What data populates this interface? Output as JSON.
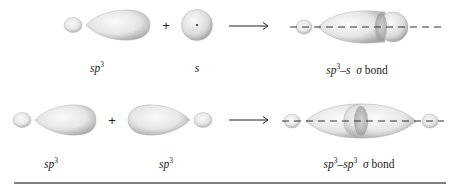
{
  "figure": {
    "row1": {
      "orbital_a": {
        "label_main": "sp",
        "label_sup": "3"
      },
      "operator": "+",
      "orbital_b": {
        "label_main": "s",
        "label_sup": ""
      },
      "result": {
        "label_a": "sp",
        "label_a_sup": "3",
        "dash": "–",
        "label_b": "s",
        "bond_symbol": "σ",
        "bond_word": "bond"
      }
    },
    "row2": {
      "orbital_a": {
        "label_main": "sp",
        "label_sup": "3"
      },
      "operator": "+",
      "orbital_b": {
        "label_main": "sp",
        "label_sup": "3"
      },
      "result": {
        "label_a": "sp",
        "label_a_sup": "3",
        "dash": "–",
        "label_b": "sp",
        "label_b_sup": "3",
        "bond_symbol": "σ",
        "bond_word": "bond"
      }
    },
    "colors": {
      "orbital_fill": "#e8e8e8",
      "orbital_shade": "#a8a8a8",
      "axis": "#333333",
      "rule": "#555555"
    }
  }
}
